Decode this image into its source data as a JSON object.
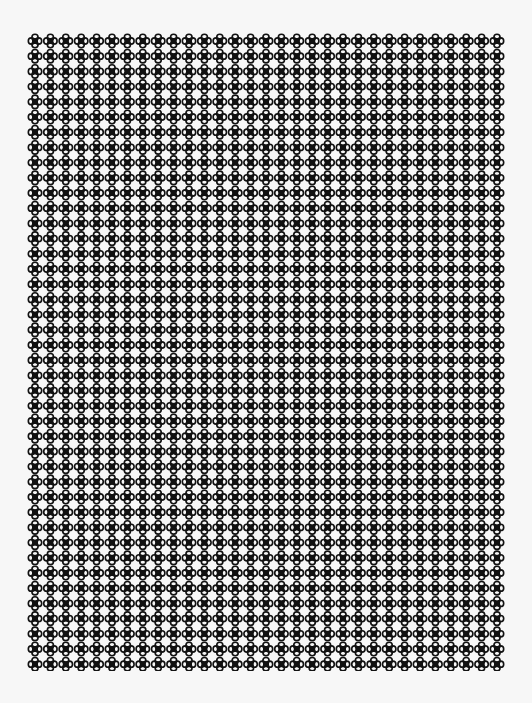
{
  "pattern": {
    "motif": "quatrefoil-icon",
    "columns": 31,
    "rows": 42,
    "cell_width": 15.4,
    "cell_height": 15.2,
    "motif_color": "#111111",
    "background_color": "#f7f7f7"
  }
}
